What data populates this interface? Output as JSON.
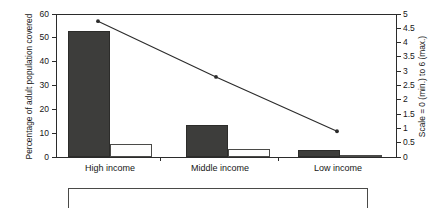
{
  "chart_data": {
    "type": "bar",
    "title": "",
    "categories": [
      "High income",
      "Middle income",
      "Low income"
    ],
    "series": [
      {
        "name": "dark-bar",
        "axis": "left",
        "values": [
          53,
          13.5,
          3
        ]
      },
      {
        "name": "light-bar",
        "axis": "left",
        "values": [
          5.5,
          3.5,
          0.5
        ]
      },
      {
        "name": "line",
        "axis": "right",
        "values": [
          4.75,
          2.8,
          0.9
        ]
      }
    ],
    "xlabel": "",
    "ylabel": "Percentage of adult population covered",
    "ylabel_right": "Scale = 0 (min.) to 6 (max.)",
    "ylim": [
      0,
      60
    ],
    "ylim_right": [
      0,
      5
    ],
    "yticks": [
      0,
      10,
      20,
      30,
      40,
      50,
      60
    ],
    "yticks_right": [
      0,
      0.5,
      1,
      1.5,
      2,
      2.5,
      3,
      3.5,
      4,
      4.5,
      5
    ],
    "ytick_labels": [
      "0",
      "10",
      "20",
      "30",
      "40",
      "50",
      "60"
    ],
    "ytick_labels_right": [
      "0",
      "0.5",
      "1",
      "1.5",
      "2",
      "2.5",
      "3",
      "3.5",
      "4",
      "4.5",
      "5"
    ],
    "grid": false,
    "legend": "none"
  },
  "axes": {
    "left": {
      "title": "Percentage of adult population covered",
      "ticks": [
        "0",
        "10",
        "20",
        "30",
        "40",
        "50",
        "60"
      ]
    },
    "right": {
      "title": "Scale = 0 (min.) to 6 (max.)",
      "ticks": [
        "0",
        "0.5",
        "1",
        "1.5",
        "2",
        "2.5",
        "3",
        "3.5",
        "4",
        "4.5",
        "5"
      ]
    },
    "x": {
      "categories": [
        "High income",
        "Middle income",
        "Low income"
      ]
    }
  },
  "legend_box": {
    "text": ""
  },
  "colors": {
    "dark_bar": "#3d3d3b",
    "light_bar": "#fdfdfd",
    "line": "#2b2b2b",
    "axis": "#2b2b2b",
    "background": "#ffffff"
  }
}
